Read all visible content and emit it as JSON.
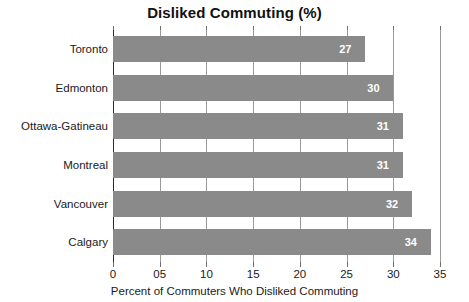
{
  "chart_data": {
    "type": "bar",
    "orientation": "horizontal",
    "title": "Disliked Commuting (%)",
    "xlabel": "Percent of Commuters Who Disliked Commuting",
    "ylabel": "",
    "categories": [
      "Toronto",
      "Edmonton",
      "Ottawa-Gatineau",
      "Montreal",
      "Vancouver",
      "Calgary"
    ],
    "values": [
      27,
      30,
      31,
      31,
      32,
      34
    ],
    "value_labels": [
      "27",
      "30",
      "31",
      "31",
      "32",
      "34"
    ],
    "xlim": [
      0,
      35
    ],
    "xticks": [
      0,
      5,
      10,
      15,
      20,
      25,
      30,
      35
    ],
    "xtick_labels": [
      "0",
      "05",
      "10",
      "15",
      "20",
      "25",
      "30",
      "35"
    ],
    "grid": true,
    "grid_axis": "x",
    "legend": null,
    "bar_color": "#8a8a8a",
    "value_label_color": "#ffffff",
    "gridline_color": "#9a9a9a",
    "axis_color": "#2b2b2b",
    "background_color": "#ffffff"
  }
}
